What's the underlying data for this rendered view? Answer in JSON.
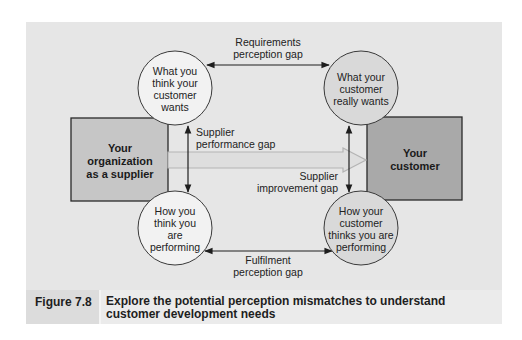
{
  "figure": {
    "label": "Figure 7.8",
    "caption": "Explore the potential perception mismatches to understand customer development needs"
  },
  "boxes": {
    "supplier": {
      "lines": [
        "Your",
        "organization",
        "as a supplier"
      ],
      "fill": "#c6c6c6"
    },
    "customer": {
      "lines": [
        "Your",
        "customer"
      ],
      "fill": "#a9a9a9"
    }
  },
  "nodes": {
    "think_wants": {
      "lines": [
        "What you",
        "think your",
        "customer",
        "wants"
      ],
      "fill": "#f2f2f2"
    },
    "really_wants": {
      "lines": [
        "What your",
        "customer",
        "really wants"
      ],
      "fill": "#d9d9d9"
    },
    "think_performing": {
      "lines": [
        "How you",
        "think you",
        "are",
        "performing"
      ],
      "fill": "#f2f2f2"
    },
    "customer_thinks": {
      "lines": [
        "How your",
        "customer",
        "thinks you are",
        "performing"
      ],
      "fill": "#d9d9d9"
    }
  },
  "gaps": {
    "requirements": [
      "Requirements",
      "perception gap"
    ],
    "supplier_performance": [
      "Supplier",
      "performance gap"
    ],
    "supplier_improvement": [
      "Supplier",
      "improvement gap"
    ],
    "fulfilment": [
      "Fulfilment",
      "perception gap"
    ]
  },
  "colors": {
    "panel_bg": "#e6e6e6",
    "line": "#1e1e1e",
    "hollow_arrow": "#b8b8b8"
  }
}
